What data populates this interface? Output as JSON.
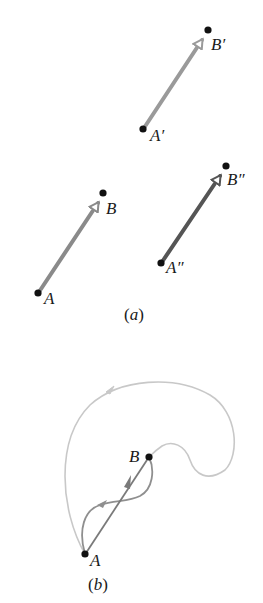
{
  "figure": {
    "panel_a": {
      "caption_open": "(",
      "caption_letter": "a",
      "caption_close": ")",
      "vectors": [
        {
          "tail_label": "A",
          "head_label": "B",
          "color": "#8a8a8a"
        },
        {
          "tail_label": "A′",
          "head_label": "B′",
          "color": "#9a9a9a"
        },
        {
          "tail_label": "A″",
          "head_label": "B″",
          "color": "#555555"
        }
      ]
    },
    "panel_b": {
      "caption_open": "(",
      "caption_letter": "b",
      "caption_close": ")",
      "point_a_label": "A",
      "point_b_label": "B",
      "colors": {
        "straight_vector": "#7a7a7a",
        "s_curve_path": "#8f8f8f",
        "loop_path": "#c8c8c8"
      }
    },
    "colors": {
      "point": "#111111",
      "text": "#1a1a1a"
    }
  }
}
